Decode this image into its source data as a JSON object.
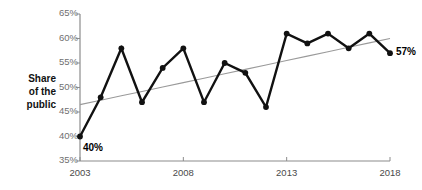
{
  "chart_data": {
    "type": "line",
    "title": "",
    "xlabel": "",
    "ylabel": "Share of the public",
    "x": [
      2003,
      2004,
      2005,
      2006,
      2007,
      2008,
      2009,
      2010,
      2011,
      2012,
      2013,
      2014,
      2015,
      2016,
      2017,
      2018
    ],
    "series": [
      {
        "name": "Share of the public",
        "values": [
          40,
          48,
          58,
          47,
          54,
          58,
          47,
          55,
          53,
          46,
          61,
          59,
          61,
          58,
          61,
          57
        ]
      },
      {
        "name": "trend",
        "values": [
          46.5,
          47.4,
          48.3,
          49.2,
          50.1,
          51.0,
          51.9,
          52.8,
          53.7,
          54.6,
          55.5,
          56.4,
          57.3,
          58.2,
          59.1,
          60.0
        ]
      }
    ],
    "ylim": [
      35,
      65
    ],
    "xlim": [
      2003,
      2018
    ],
    "ytick_labels": [
      "65%",
      "60%",
      "55%",
      "50%",
      "45%",
      "40%",
      "35%"
    ],
    "ytick_values": [
      65,
      60,
      55,
      50,
      45,
      40,
      35
    ],
    "xtick_labels": [
      "2003",
      "2008",
      "2013",
      "2018"
    ],
    "xtick_values": [
      2003,
      2008,
      2013,
      2018
    ],
    "grid": false,
    "legend": "none",
    "annotations": [
      {
        "name": "start-value",
        "text": "40%",
        "x": 2003,
        "y": 40
      },
      {
        "name": "end-value",
        "text": "57%",
        "x": 2018,
        "y": 57
      }
    ],
    "colors": {
      "line": "#111111",
      "trend": "#9a9a9a",
      "axis": "#8c8c8c",
      "tick_text": "#6f6f6f",
      "annotation": "#000000"
    }
  },
  "axis_title": {
    "line1": "Share",
    "line2": "of the",
    "line3": "public"
  },
  "yticks": [
    {
      "label": "65%"
    },
    {
      "label": "60%"
    },
    {
      "label": "55%"
    },
    {
      "label": "50%"
    },
    {
      "label": "45%"
    },
    {
      "label": "40%"
    },
    {
      "label": "35%"
    }
  ],
  "xticks": [
    {
      "label": "2003"
    },
    {
      "label": "2008"
    },
    {
      "label": "2013"
    },
    {
      "label": "2018"
    }
  ],
  "annotations": {
    "start": "40%",
    "end": "57%"
  }
}
